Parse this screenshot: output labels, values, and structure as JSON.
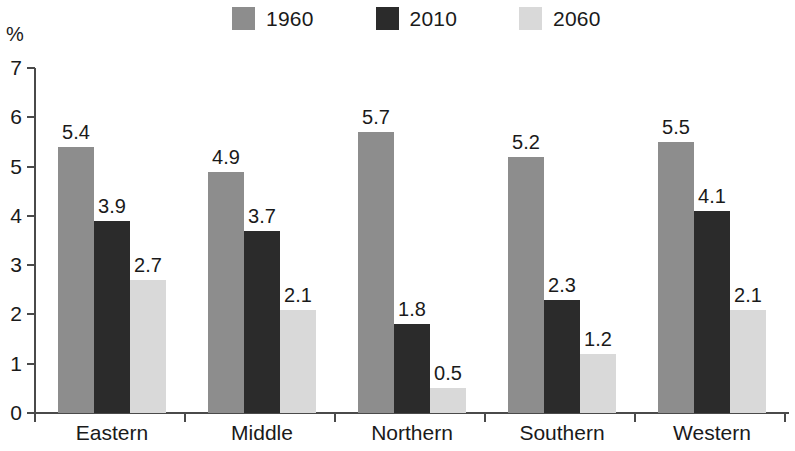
{
  "chart_data": {
    "type": "bar",
    "title": "",
    "subtitle": "",
    "xlabel": "",
    "ylabel": "%",
    "ylim": [
      0,
      7
    ],
    "y_ticks": [
      "0",
      "1",
      "2",
      "3",
      "4",
      "5",
      "6",
      "7"
    ],
    "grid": false,
    "legend_position": "top-center",
    "categories": [
      "Eastern",
      "Middle",
      "Northern",
      "Southern",
      "Western"
    ],
    "series": [
      {
        "name": "1960",
        "color": "#8d8d8d",
        "values": [
          5.4,
          4.9,
          5.7,
          5.2,
          5.5
        ],
        "labels": [
          "5.4",
          "4.9",
          "5.7",
          "5.2",
          "5.5"
        ]
      },
      {
        "name": "2010",
        "color": "#2b2b2b",
        "values": [
          3.9,
          3.7,
          1.8,
          2.3,
          4.1
        ],
        "labels": [
          "3.9",
          "3.7",
          "1.8",
          "2.3",
          "4.1"
        ]
      },
      {
        "name": "2060",
        "color": "#d9d9d9",
        "values": [
          2.7,
          2.1,
          0.5,
          1.2,
          2.1
        ],
        "labels": [
          "2.7",
          "2.1",
          "0.5",
          "1.2",
          "2.1"
        ]
      }
    ]
  },
  "legend": {
    "items": [
      {
        "label": "1960",
        "color": "#8d8d8d"
      },
      {
        "label": "2010",
        "color": "#2b2b2b"
      },
      {
        "label": "2060",
        "color": "#d9d9d9"
      }
    ]
  },
  "axes": {
    "y_unit": "%",
    "y_ticks": [
      "7",
      "6",
      "5",
      "4",
      "3",
      "2",
      "1",
      "0"
    ],
    "x_categories": [
      "Eastern",
      "Middle",
      "Northern",
      "Southern",
      "Western"
    ]
  },
  "colors": {
    "axis": "#4a4a4a",
    "text": "#1a1a1a",
    "background": "#ffffff",
    "series_1960": "#8d8d8d",
    "series_2010": "#2b2b2b",
    "series_2060": "#d9d9d9"
  }
}
